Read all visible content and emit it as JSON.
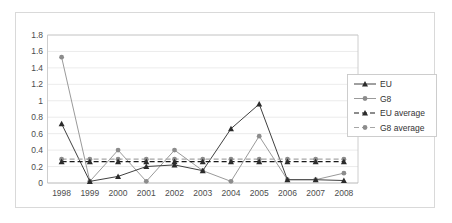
{
  "chart_data": {
    "type": "line",
    "title": "",
    "xlabel": "",
    "ylabel": "",
    "categories": [
      "1998",
      "1999",
      "2000",
      "2001",
      "2002",
      "2003",
      "2004",
      "2005",
      "2006",
      "2007",
      "2008"
    ],
    "ylim": [
      0,
      1.8
    ],
    "ytick_values": [
      "0",
      "0.2",
      "0.4",
      "0.6",
      "0.8",
      "1",
      "1.2",
      "1.4",
      "1.6",
      "1.8"
    ],
    "grid": true,
    "legend_position": "right",
    "series": [
      {
        "name": "EU",
        "marker": "triangle",
        "style": "solid",
        "color": "#2b2b2b",
        "values": [
          0.72,
          0.02,
          0.08,
          0.2,
          0.22,
          0.15,
          0.66,
          0.96,
          0.04,
          0.04,
          0.03
        ]
      },
      {
        "name": "G8",
        "marker": "circle",
        "style": "solid",
        "color": "#8c8c8c",
        "values": [
          1.53,
          0.02,
          0.4,
          0.02,
          0.4,
          0.15,
          0.02,
          0.57,
          0.04,
          0.04,
          0.12
        ]
      },
      {
        "name": "EU average",
        "marker": "triangle",
        "style": "dashed",
        "color": "#1a1a1a",
        "constant": 0.26,
        "values": [
          0.26,
          0.26,
          0.26,
          0.26,
          0.26,
          0.26,
          0.26,
          0.26,
          0.26,
          0.26,
          0.26
        ]
      },
      {
        "name": "G8 average",
        "marker": "circle",
        "style": "dashed",
        "color": "#a6a6a6",
        "constant": 0.29,
        "values": [
          0.29,
          0.29,
          0.29,
          0.29,
          0.29,
          0.29,
          0.29,
          0.29,
          0.29,
          0.29,
          0.29
        ]
      }
    ]
  },
  "legend": {
    "items": [
      {
        "label": "EU"
      },
      {
        "label": "G8"
      },
      {
        "label": "EU average"
      },
      {
        "label": "G8 average"
      }
    ]
  },
  "axes": {
    "y_ticks": [
      "1.8",
      "1.6",
      "1.4",
      "1.2",
      "1",
      "0.8",
      "0.6",
      "0.4",
      "0.2",
      "0"
    ],
    "x_ticks": [
      "1998",
      "1999",
      "2000",
      "2001",
      "2002",
      "2003",
      "2004",
      "2005",
      "2006",
      "2007",
      "2008"
    ]
  }
}
